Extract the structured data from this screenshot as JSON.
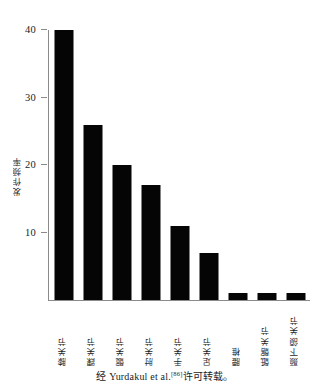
{
  "chart_data": {
    "type": "bar",
    "title": "",
    "xlabel": "",
    "ylabel": "发作频率",
    "ylim": [
      0,
      40
    ],
    "yticks": [
      10,
      20,
      30,
      40
    ],
    "grid": false,
    "legend": null,
    "categories": [
      "膝关节",
      "踝关节",
      "髋关节",
      "肘关节",
      "手关节",
      "足关节",
      "腰椎",
      "骶髂关节",
      "颞下颌关节"
    ],
    "values": [
      40,
      26,
      20,
      17,
      11,
      7,
      1,
      1,
      1
    ],
    "bar_color": "#050505",
    "axis_color": "#8a8a8a",
    "background": "#ffffff"
  },
  "caption": {
    "prefix": "经 Yurdakul et al.",
    "reference": "[86]",
    "suffix": "许可转载。"
  }
}
